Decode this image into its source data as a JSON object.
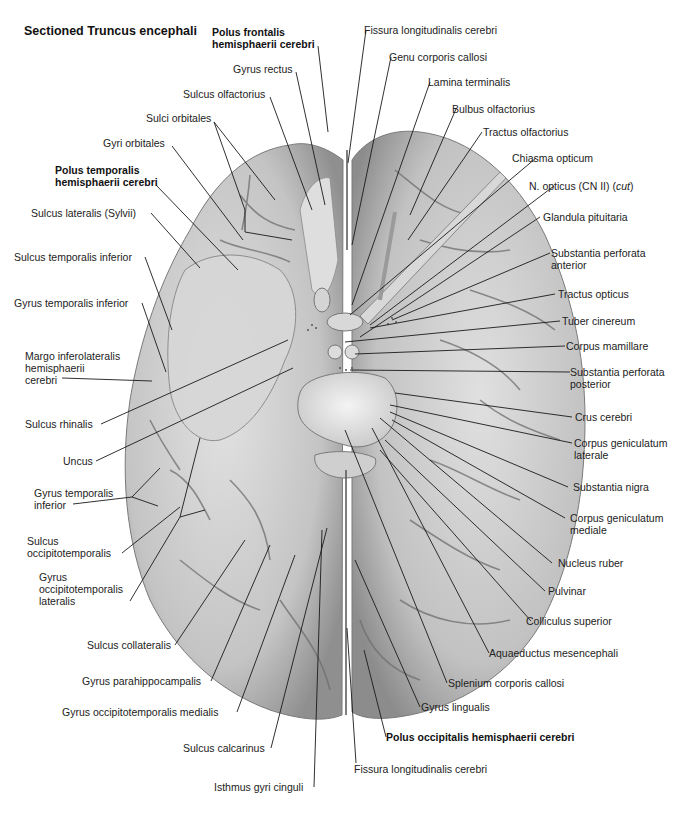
{
  "title": "Sectioned Truncus encephali",
  "colors": {
    "background": "#ffffff",
    "brain_fill": "#c9c9c9",
    "brain_shadow": "#8e8e8e",
    "brain_highlight": "#e6e6e6",
    "sulcus_lines": "#6b6b6b",
    "leader_lines": "#1a1a1a",
    "label_text": "#222222"
  },
  "labels": {
    "top": [
      {
        "id": "polus-frontalis",
        "lines": [
          "Polus frontalis",
          "hemisphaerii cerebri"
        ],
        "bold": true
      },
      {
        "id": "gyrus-rectus",
        "lines": [
          "Gyrus rectus"
        ],
        "bold": false
      },
      {
        "id": "sulcus-olfactorius",
        "lines": [
          "Sulcus olfactorius"
        ],
        "bold": false
      },
      {
        "id": "sulci-orbitales",
        "lines": [
          "Sulci orbitales"
        ],
        "bold": false
      },
      {
        "id": "gyri-orbitales",
        "lines": [
          "Gyri orbitales"
        ],
        "bold": false
      },
      {
        "id": "fissura-longitudinalis-top",
        "lines": [
          "Fissura longitudinalis cerebri"
        ],
        "bold": false
      },
      {
        "id": "genu-corporis-callosi",
        "lines": [
          "Genu corporis callosi"
        ],
        "bold": false
      },
      {
        "id": "lamina-terminalis",
        "lines": [
          "Lamina terminalis"
        ],
        "bold": false
      },
      {
        "id": "bulbus-olfactorius",
        "lines": [
          "Bulbus olfactorius"
        ],
        "bold": false
      },
      {
        "id": "tractus-olfactorius",
        "lines": [
          "Tractus olfactorius"
        ],
        "bold": false
      }
    ],
    "left": [
      {
        "id": "polus-temporalis",
        "lines": [
          "Polus temporalis",
          "hemisphaerii cerebri"
        ],
        "bold": true
      },
      {
        "id": "sulcus-lateralis",
        "lines": [
          "Sulcus lateralis (Sylvii)"
        ],
        "bold": false
      },
      {
        "id": "sulcus-temporalis-inferior",
        "lines": [
          "Sulcus temporalis inferior"
        ],
        "bold": false
      },
      {
        "id": "gyrus-temporalis-inferior-1",
        "lines": [
          "Gyrus temporalis inferior"
        ],
        "bold": false
      },
      {
        "id": "margo-inferolateralis",
        "lines": [
          "Margo inferolateralis",
          "hemisphaerii",
          "cerebri"
        ],
        "bold": false
      },
      {
        "id": "sulcus-rhinalis",
        "lines": [
          "Sulcus rhinalis"
        ],
        "bold": false
      },
      {
        "id": "uncus",
        "lines": [
          "Uncus"
        ],
        "bold": false
      },
      {
        "id": "gyrus-temporalis-inferior-2",
        "lines": [
          "Gyrus temporalis",
          "inferior"
        ],
        "bold": false
      },
      {
        "id": "sulcus-occipitotemporalis",
        "lines": [
          "Sulcus",
          "occipitotemporalis"
        ],
        "bold": false
      },
      {
        "id": "gyrus-occipitotemporalis-lateralis",
        "lines": [
          "Gyrus",
          "occipitotemporalis",
          "lateralis"
        ],
        "bold": false
      }
    ],
    "right": [
      {
        "id": "chiasma-opticum",
        "lines": [
          "Chiasma opticum"
        ],
        "bold": false
      },
      {
        "id": "n-opticus",
        "lines": [
          "N. opticus (CN II) (cut)"
        ],
        "bold": false
      },
      {
        "id": "glandula-pituitaria",
        "lines": [
          "Glandula pituitaria"
        ],
        "bold": false
      },
      {
        "id": "substantia-perforata-anterior",
        "lines": [
          "Substantia perforata",
          "anterior"
        ],
        "bold": false
      },
      {
        "id": "tractus-opticus",
        "lines": [
          "Tractus opticus"
        ],
        "bold": false
      },
      {
        "id": "tuber-cinereum",
        "lines": [
          "Tuber cinereum"
        ],
        "bold": false
      },
      {
        "id": "corpus-mamillare",
        "lines": [
          "Corpus mamillare"
        ],
        "bold": false
      },
      {
        "id": "substantia-perforata-posterior",
        "lines": [
          "Substantia perforata",
          "posterior"
        ],
        "bold": false
      },
      {
        "id": "crus-cerebri",
        "lines": [
          "Crus cerebri"
        ],
        "bold": false
      },
      {
        "id": "corpus-geniculatum-laterale",
        "lines": [
          "Corpus geniculatum",
          "laterale"
        ],
        "bold": false
      },
      {
        "id": "substantia-nigra",
        "lines": [
          "Substantia nigra"
        ],
        "bold": false
      },
      {
        "id": "corpus-geniculatum-mediale",
        "lines": [
          "Corpus geniculatum",
          "mediale"
        ],
        "bold": false
      },
      {
        "id": "nucleus-ruber",
        "lines": [
          "Nucleus ruber"
        ],
        "bold": false
      },
      {
        "id": "pulvinar",
        "lines": [
          "Pulvinar"
        ],
        "bold": false
      },
      {
        "id": "colliculus-superior",
        "lines": [
          "Colliculus superior"
        ],
        "bold": false
      },
      {
        "id": "aquaeductus-mesencephali",
        "lines": [
          "Aquaeductus mesencephali"
        ],
        "bold": false
      },
      {
        "id": "splenium-corporis-callosi",
        "lines": [
          "Splenium corporis callosi"
        ],
        "bold": false
      },
      {
        "id": "gyrus-lingualis",
        "lines": [
          "Gyrus lingualis"
        ],
        "bold": false
      },
      {
        "id": "polus-occipitalis",
        "lines": [
          "Polus occipitalis hemisphaerii cerebri"
        ],
        "bold": true
      }
    ],
    "bottom": [
      {
        "id": "sulcus-collateralis",
        "lines": [
          "Sulcus collateralis"
        ],
        "bold": false
      },
      {
        "id": "gyrus-parahippocampalis",
        "lines": [
          "Gyrus parahippocampalis"
        ],
        "bold": false
      },
      {
        "id": "gyrus-occipitotemporalis-medialis",
        "lines": [
          "Gyrus occipitotemporalis medialis"
        ],
        "bold": false
      },
      {
        "id": "sulcus-calcarinus",
        "lines": [
          "Sulcus calcarinus"
        ],
        "bold": false
      },
      {
        "id": "isthmus-gyri-cinguli",
        "lines": [
          "Isthmus gyri cinguli"
        ],
        "bold": false
      },
      {
        "id": "fissura-longitudinalis-bottom",
        "lines": [
          "Fissura longitudinalis cerebri"
        ],
        "bold": false
      }
    ]
  },
  "text": {
    "polus_frontalis_1": "Polus frontalis",
    "polus_frontalis_2": "hemisphaerii cerebri",
    "gyrus_rectus": "Gyrus rectus",
    "sulcus_olfactorius": "Sulcus olfactorius",
    "sulci_orbitales": "Sulci orbitales",
    "gyri_orbitales": "Gyri orbitales",
    "fissura_top": "Fissura longitudinalis cerebri",
    "genu": "Genu corporis callosi",
    "lamina": "Lamina terminalis",
    "bulbus": "Bulbus olfactorius",
    "tractus_olf": "Tractus olfactorius",
    "chiasma": "Chiasma opticum",
    "n_opticus_a": "N. opticus (CN II) (",
    "n_opticus_b": "cut",
    "n_opticus_c": ")",
    "glandula": "Glandula pituitaria",
    "sp_ant_1": "Substantia perforata",
    "sp_ant_2": "anterior",
    "tractus_opt": "Tractus opticus",
    "tuber": "Tuber cinereum",
    "mamillare": "Corpus mamillare",
    "sp_post_1": "Substantia perforata",
    "sp_post_2": "posterior",
    "crus": "Crus cerebri",
    "cgl_1": "Corpus geniculatum",
    "cgl_2": "laterale",
    "nigra": "Substantia nigra",
    "cgm_1": "Corpus geniculatum",
    "cgm_2": "mediale",
    "ruber": "Nucleus ruber",
    "pulvinar": "Pulvinar",
    "colliculus": "Colliculus superior",
    "aquaeductus": "Aquaeductus mesencephali",
    "splenium": "Splenium corporis callosi",
    "lingualis": "Gyrus lingualis",
    "polus_occ": "Polus occipitalis hemisphaerii cerebri",
    "fissura_bottom": "Fissura longitudinalis cerebri",
    "isthmus": "Isthmus gyri cinguli",
    "calcarinus": "Sulcus calcarinus",
    "got_med": "Gyrus occipitotemporalis medialis",
    "parahippo": "Gyrus parahippocampalis",
    "collateralis": "Sulcus collateralis",
    "got_lat_1": "Gyrus",
    "got_lat_2": "occipitotemporalis",
    "got_lat_3": "lateralis",
    "sot_1": "Sulcus",
    "sot_2": "occipitotemporalis",
    "gti2_1": "Gyrus temporalis",
    "gti2_2": "inferior",
    "uncus": "Uncus",
    "rhinalis": "Sulcus rhinalis",
    "margo_1": "Margo inferolateralis",
    "margo_2": "hemisphaerii",
    "margo_3": "cerebri",
    "gti1": "Gyrus temporalis inferior",
    "sti": "Sulcus temporalis inferior",
    "sylvii": "Sulcus lateralis (Sylvii)",
    "polus_temp_1": "Polus temporalis",
    "polus_temp_2": "hemisphaerii cerebri"
  }
}
